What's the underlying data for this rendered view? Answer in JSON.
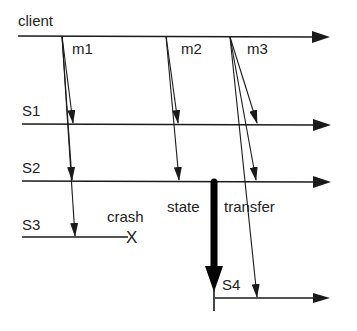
{
  "diagram": {
    "type": "message-sequence / process timeline",
    "processes": [
      {
        "id": "client",
        "label": "client"
      },
      {
        "id": "S1",
        "label": "S1"
      },
      {
        "id": "S2",
        "label": "S2"
      },
      {
        "id": "S3",
        "label": "S3"
      },
      {
        "id": "S4",
        "label": "S4"
      }
    ],
    "messages": [
      {
        "id": "m1",
        "label": "m1",
        "from": "client",
        "to": [
          "S1",
          "S2",
          "S3"
        ]
      },
      {
        "id": "m2",
        "label": "m2",
        "from": "client",
        "to": [
          "S1",
          "S2"
        ]
      },
      {
        "id": "m3",
        "label": "m3",
        "from": "client",
        "to": [
          "S1",
          "S2",
          "S4"
        ]
      }
    ],
    "events": {
      "crash": {
        "label": "crash",
        "marker": "X",
        "process": "S3"
      },
      "state_transfer": {
        "label_left": "state",
        "label_right": "transfer",
        "from": "S2",
        "to": "S4"
      }
    },
    "colors": {
      "line": "#1a1a1a",
      "background": "#ffffff"
    }
  }
}
